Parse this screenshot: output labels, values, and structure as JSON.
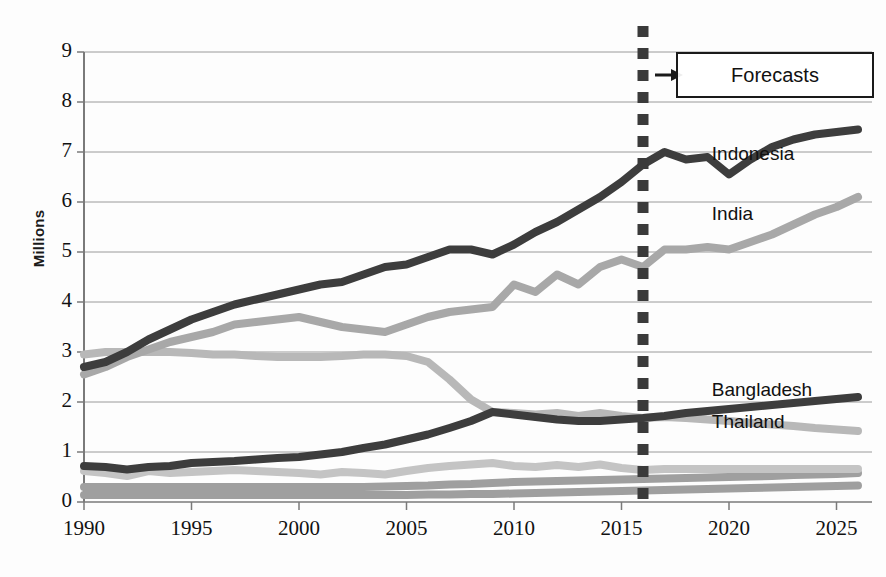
{
  "chart_data": {
    "type": "line",
    "title": "",
    "subtitle": "",
    "xlabel": "",
    "ylabel": "Millions",
    "xlim": [
      1990,
      2026
    ],
    "ylim": [
      0,
      9
    ],
    "grid": true,
    "legend_position": "inline-right-labels",
    "x_ticks": [
      "1990",
      "1995",
      "2000",
      "2005",
      "2010",
      "2015",
      "2020",
      "2025"
    ],
    "x_tick_values": [
      1990,
      1995,
      2000,
      2005,
      2010,
      2015,
      2020,
      2025
    ],
    "y_ticks": [
      "0",
      "1",
      "2",
      "3",
      "4",
      "5",
      "6",
      "7",
      "8",
      "9"
    ],
    "y_tick_values": [
      0,
      1,
      2,
      3,
      4,
      5,
      6,
      7,
      8,
      9
    ],
    "x": [
      1990,
      1991,
      1992,
      1993,
      1994,
      1995,
      1996,
      1997,
      1998,
      1999,
      2000,
      2001,
      2002,
      2003,
      2004,
      2005,
      2006,
      2007,
      2008,
      2009,
      2010,
      2011,
      2012,
      2013,
      2014,
      2015,
      2016,
      2017,
      2018,
      2019,
      2020,
      2021,
      2022,
      2023,
      2024,
      2025,
      2026
    ],
    "forecast_start": 2016,
    "annotations": [
      {
        "name": "forecast-divider",
        "type": "vertical-dashed-line",
        "x": 2016,
        "color": "#3a3a3a"
      },
      {
        "name": "forecast-callout",
        "type": "box-with-arrow",
        "text": "Forecasts",
        "x": 2016
      }
    ],
    "series": [
      {
        "name": "Indonesia",
        "color": "#3d3d3d",
        "label_x": 2019.2,
        "label_y": 6.95,
        "values": [
          2.7,
          2.8,
          3.0,
          3.25,
          3.45,
          3.65,
          3.8,
          3.95,
          4.05,
          4.15,
          4.25,
          4.35,
          4.4,
          4.55,
          4.7,
          4.75,
          4.9,
          5.05,
          5.05,
          4.95,
          5.15,
          5.4,
          5.6,
          5.85,
          6.1,
          6.4,
          6.75,
          7.0,
          6.85,
          6.9,
          6.55,
          6.85,
          7.1,
          7.25,
          7.35,
          7.4,
          7.45
        ]
      },
      {
        "name": "India",
        "color": "#a8a8a8",
        "label_x": 2019.2,
        "label_y": 5.75,
        "values": [
          2.55,
          2.7,
          2.9,
          3.05,
          3.2,
          3.3,
          3.4,
          3.55,
          3.6,
          3.65,
          3.7,
          3.6,
          3.5,
          3.45,
          3.4,
          3.55,
          3.7,
          3.8,
          3.85,
          3.9,
          4.35,
          4.2,
          4.55,
          4.35,
          4.7,
          4.85,
          4.7,
          5.05,
          5.05,
          5.1,
          5.05,
          5.2,
          5.35,
          5.55,
          5.75,
          5.9,
          6.1
        ]
      },
      {
        "name": "Thailand",
        "color": "#b8b8b8",
        "label_x": 2019.2,
        "label_y": 1.58,
        "values": [
          2.95,
          3.0,
          3.0,
          3.0,
          3.0,
          2.98,
          2.95,
          2.95,
          2.92,
          2.9,
          2.9,
          2.9,
          2.92,
          2.95,
          2.95,
          2.92,
          2.8,
          2.45,
          2.05,
          1.8,
          1.78,
          1.75,
          1.78,
          1.72,
          1.78,
          1.72,
          1.68,
          1.7,
          1.68,
          1.65,
          1.62,
          1.58,
          1.55,
          1.52,
          1.48,
          1.45,
          1.42
        ]
      },
      {
        "name": "Bangladesh",
        "color": "#3d3d3d",
        "label_x": 2019.2,
        "label_y": 2.22,
        "values": [
          0.72,
          0.7,
          0.65,
          0.7,
          0.72,
          0.78,
          0.8,
          0.82,
          0.85,
          0.88,
          0.9,
          0.95,
          1.0,
          1.08,
          1.15,
          1.25,
          1.35,
          1.48,
          1.62,
          1.8,
          1.75,
          1.7,
          1.65,
          1.62,
          1.62,
          1.65,
          1.68,
          1.72,
          1.78,
          1.82,
          1.86,
          1.9,
          1.94,
          1.98,
          2.02,
          2.06,
          2.1
        ]
      },
      {
        "name": "series-5",
        "color": "#c4c4c4",
        "label_x": null,
        "label_y": null,
        "values": [
          0.62,
          0.58,
          0.52,
          0.62,
          0.58,
          0.6,
          0.62,
          0.64,
          0.62,
          0.6,
          0.58,
          0.55,
          0.6,
          0.58,
          0.55,
          0.62,
          0.68,
          0.72,
          0.75,
          0.78,
          0.72,
          0.7,
          0.74,
          0.7,
          0.75,
          0.68,
          0.64,
          0.66,
          0.66,
          0.66,
          0.66,
          0.66,
          0.66,
          0.66,
          0.66,
          0.66,
          0.66
        ]
      },
      {
        "name": "series-6",
        "color": "#9f9f9f",
        "label_x": null,
        "label_y": null,
        "values": [
          0.3,
          0.3,
          0.3,
          0.3,
          0.3,
          0.3,
          0.3,
          0.3,
          0.3,
          0.3,
          0.3,
          0.3,
          0.3,
          0.3,
          0.31,
          0.32,
          0.33,
          0.35,
          0.36,
          0.38,
          0.4,
          0.41,
          0.42,
          0.43,
          0.44,
          0.45,
          0.46,
          0.47,
          0.48,
          0.49,
          0.5,
          0.51,
          0.52,
          0.54,
          0.55,
          0.56,
          0.58
        ]
      },
      {
        "name": "series-7",
        "color": "#9f9f9f",
        "label_x": null,
        "label_y": null,
        "values": [
          0.14,
          0.14,
          0.14,
          0.14,
          0.14,
          0.14,
          0.14,
          0.14,
          0.14,
          0.14,
          0.14,
          0.14,
          0.14,
          0.14,
          0.14,
          0.14,
          0.15,
          0.15,
          0.16,
          0.16,
          0.17,
          0.18,
          0.19,
          0.2,
          0.21,
          0.22,
          0.23,
          0.24,
          0.25,
          0.26,
          0.27,
          0.28,
          0.29,
          0.3,
          0.31,
          0.32,
          0.33
        ]
      }
    ]
  },
  "axis": {
    "y_title": "Millions"
  },
  "forecast": {
    "label": "Forecasts"
  }
}
